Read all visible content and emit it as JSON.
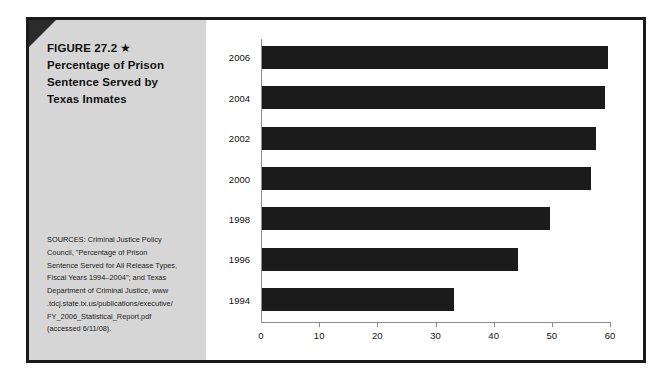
{
  "figure": {
    "title_lines": [
      "FIGURE 27.2",
      "Percentage of Prison",
      "Sentence Served by",
      "Texas Inmates"
    ],
    "star_glyph": "★",
    "sources_lines": [
      "SOURCES: Criminal Justice Policy",
      "Council, \"Percentage of Prison",
      "Sentence Served for All Release Types,",
      "Fiscal Years 1994–2004\"; and Texas",
      "Department of Criminal Justice, www",
      ".tdcj.state.tx.us/publications/executive/",
      "FY_2006_Statistical_Report.pdf",
      "(accessed 6/11/08)."
    ],
    "panel_color": "#d6d6d6",
    "bar_color": "#1b1b1b",
    "frame_color": "#1a1a1a",
    "axis_color": "#8c8c8c"
  },
  "chart_data": {
    "type": "bar",
    "orientation": "horizontal",
    "title": "Percentage of Prison Sentence Served by Texas Inmates",
    "xlabel": "",
    "ylabel": "",
    "categories": [
      "2006",
      "2004",
      "2002",
      "2000",
      "1998",
      "1996",
      "1994"
    ],
    "values": [
      59.5,
      59,
      57.5,
      56.5,
      49.5,
      44,
      33
    ],
    "xlim": [
      0,
      60
    ],
    "xticks": [
      0,
      10,
      20,
      30,
      40,
      50,
      60
    ],
    "xtick_labels": [
      "0",
      "10",
      "20",
      "30",
      "40",
      "50",
      "60"
    ],
    "grid": false,
    "legend": false,
    "series": [
      {
        "name": "Percentage of sentence served",
        "values": [
          59.5,
          59,
          57.5,
          56.5,
          49.5,
          44,
          33
        ]
      }
    ]
  }
}
